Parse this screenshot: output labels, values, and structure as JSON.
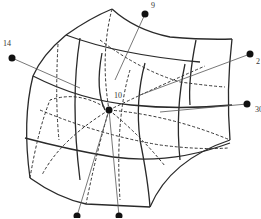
{
  "diagram": {
    "type": "curved hexahedral element with marked nodes",
    "nodes": [
      {
        "id": "node-9",
        "label": "9",
        "x": 145,
        "y": 14
      },
      {
        "id": "node-14",
        "label": "14",
        "x": 12,
        "y": 58
      },
      {
        "id": "node-10",
        "label": "10",
        "x": 109,
        "y": 110
      },
      {
        "id": "node-2",
        "label": "2",
        "x": 250,
        "y": 54
      },
      {
        "id": "node-30",
        "label": "30",
        "x": 247,
        "y": 104
      },
      {
        "id": "node-bottom-left",
        "label": "",
        "x": 77,
        "y": 216
      },
      {
        "id": "node-bottom-right",
        "label": "",
        "x": 119,
        "y": 216
      }
    ],
    "colors": {
      "line": "#2a2a2a",
      "node": "#111111",
      "background": "#ffffff"
    }
  }
}
